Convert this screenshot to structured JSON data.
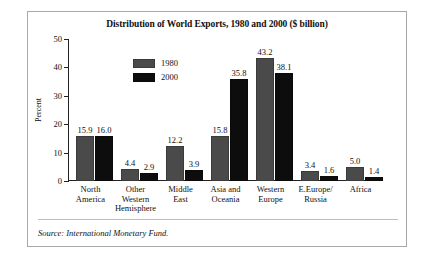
{
  "figure": {
    "title": "Distribution of World Exports, 1980 and 2000 ($ billion)",
    "source": "Source: International Monetary Fund."
  },
  "legend": {
    "items": [
      {
        "label": "1980",
        "color": "#4a4a4a"
      },
      {
        "label": "2000",
        "color": "#0d0d0d"
      }
    ]
  },
  "chart_data": {
    "type": "bar",
    "title": "Distribution of World Exports, 1980 and 2000 ($ billion)",
    "xlabel": "",
    "ylabel": "Percent",
    "ylim": [
      0,
      50
    ],
    "yticks": [
      0,
      10,
      20,
      30,
      40,
      50
    ],
    "ytick_labels": [
      "0",
      "10",
      "20",
      "30",
      "40",
      "50"
    ],
    "grid": false,
    "legend_position": "upper-left-inside",
    "categories": [
      "North America",
      "Other Western Hemisphere",
      "Middle East",
      "Asia and Oceania",
      "Western Europe",
      "E.Europe/ Russia",
      "Africa"
    ],
    "category_lines": [
      [
        "North",
        "America"
      ],
      [
        "Other",
        "Western",
        "Hemisphere"
      ],
      [
        "Middle",
        "East"
      ],
      [
        "Asia and",
        "Oceania"
      ],
      [
        "Western",
        "Europe"
      ],
      [
        "E.Europe/",
        "Russia"
      ],
      [
        "Africa"
      ]
    ],
    "series": [
      {
        "name": "1980",
        "color": "#4a4a4a",
        "values": [
          15.9,
          4.4,
          12.2,
          15.8,
          43.2,
          3.4,
          5.0
        ],
        "labels": [
          "15.9",
          "4.4",
          "12.2",
          "15.8",
          "43.2",
          "3.4",
          "5.0"
        ]
      },
      {
        "name": "2000",
        "color": "#0d0d0d",
        "values": [
          16.0,
          2.9,
          3.9,
          35.8,
          38.1,
          1.6,
          1.4
        ],
        "labels": [
          "16.0",
          "2.9",
          "3.9",
          "35.8",
          "38.1",
          "1.6",
          "1.4"
        ]
      }
    ]
  }
}
